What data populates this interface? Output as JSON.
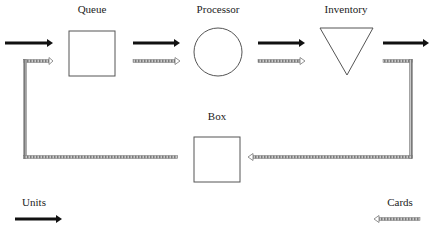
{
  "diagram": {
    "type": "flow",
    "nodes": [
      {
        "id": "queue",
        "label": "Queue",
        "shape": "square"
      },
      {
        "id": "processor",
        "label": "Processor",
        "shape": "circle"
      },
      {
        "id": "inventory",
        "label": "Inventory",
        "shape": "inverted-triangle"
      },
      {
        "id": "box",
        "label": "Box",
        "shape": "square"
      }
    ],
    "legend": {
      "units_label": "Units",
      "cards_label": "Cards"
    },
    "colors": {
      "units_arrow": "#111111",
      "cards_arrow": "#8a8a8a",
      "outline": "#555555"
    }
  }
}
